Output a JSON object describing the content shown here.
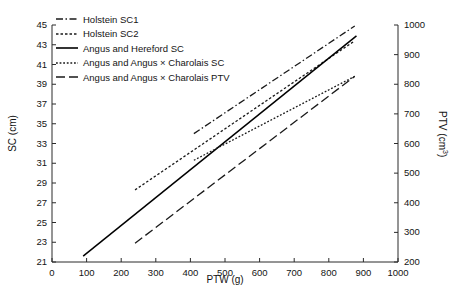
{
  "chart_data": {
    "type": "line",
    "title": "",
    "xlabel": "PTW (g)",
    "ylabel": "SC (cm)",
    "ylabel_right": "PTV (cm3)",
    "xlim": [
      0,
      1000
    ],
    "ylim": [
      21,
      45
    ],
    "ylim_right": [
      200,
      1000
    ],
    "xticks": [
      0,
      100,
      200,
      300,
      400,
      500,
      600,
      700,
      800,
      900,
      1000
    ],
    "yticks_left": [
      21,
      23,
      25,
      27,
      29,
      31,
      33,
      35,
      37,
      39,
      41,
      43,
      45
    ],
    "yticks_right": [
      200,
      300,
      400,
      500,
      600,
      700,
      800,
      900,
      1000
    ],
    "grid": false,
    "legend_position": "top-left",
    "series": [
      {
        "name": "Holstein SC1",
        "axis": "left",
        "style": "dash-dot",
        "dasharray": "7,2.5,1.5,2.5",
        "color": "#1a1a1a",
        "x": [
          410,
          875
        ],
        "y": [
          34.0,
          44.9
        ]
      },
      {
        "name": "Holstein SC2",
        "axis": "left",
        "style": "dotted",
        "dasharray": "2.5,2",
        "color": "#1a1a1a",
        "x": [
          240,
          875
        ],
        "y": [
          28.3,
          43.4
        ]
      },
      {
        "name": "Angus and Hereford SC",
        "axis": "left",
        "style": "solid",
        "dasharray": "none",
        "color": "#000000",
        "x": [
          90,
          880
        ],
        "y": [
          21.6,
          43.9
        ]
      },
      {
        "name": "Angus and Angus × Charolais SC",
        "axis": "left",
        "style": "fine-dotted",
        "dasharray": "1.8,1.8",
        "color": "#1a1a1a",
        "x": [
          410,
          875
        ],
        "y": [
          31.3,
          39.8
        ]
      },
      {
        "name": "Angus and Angus × Charolais PTV",
        "axis": "right",
        "style": "long-dash",
        "dasharray": "9,4",
        "color": "#1a1a1a",
        "x": [
          240,
          875
        ],
        "y": [
          22.9,
          39.8
        ]
      }
    ]
  },
  "axes": {
    "x_title": "PTW (g)",
    "y_left_title": "SC (cm)",
    "y_right_title_main": "PTV (cm",
    "y_right_title_sup": "3",
    "y_right_title_tail": ")",
    "x_ticks": [
      "0",
      "100",
      "200",
      "300",
      "400",
      "500",
      "600",
      "700",
      "800",
      "900",
      "1000"
    ],
    "y_left_ticks": [
      "45",
      "43",
      "41",
      "39",
      "37",
      "35",
      "33",
      "31",
      "29",
      "27",
      "25",
      "23",
      "21"
    ],
    "y_right_ticks": [
      "1000",
      "900",
      "800",
      "700",
      "600",
      "500",
      "400",
      "300",
      "200"
    ]
  },
  "legend": {
    "items": [
      {
        "label": "Holstein SC1",
        "swatch": "dash-dot-line-icon"
      },
      {
        "label": "Holstein SC2",
        "swatch": "dotted-line-icon"
      },
      {
        "label": "Angus and Hereford SC",
        "swatch": "solid-line-icon"
      },
      {
        "label": "Angus and Angus × Charolais SC",
        "swatch": "fine-dotted-line-icon"
      },
      {
        "label": "Angus and Angus × Charolais PTV",
        "swatch": "long-dash-line-icon"
      }
    ]
  },
  "colors": {
    "ink": "#1a1a1a",
    "axis": "#2b2b2b",
    "background": "#ffffff"
  }
}
